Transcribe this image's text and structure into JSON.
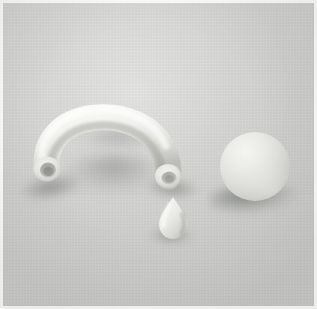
{
  "image": {
    "kind": "photograph",
    "subject": "still-life of three pale clay objects on a gray cloth background",
    "width": 317,
    "height": 309,
    "border": {
      "present": true,
      "color": "#fbfbfa",
      "width_px": 3
    }
  },
  "palette": {
    "background_base": "#d3d4d1",
    "background_light": "#d8d9d6",
    "background_dark": "#cdcecb",
    "object_highlight": "#f6f6f3",
    "object_midtone": "#e6e6e2",
    "object_shade": "#c3c4bf",
    "object_deep_shade": "#a3a49f",
    "cavity_dark": "#8e8f8a",
    "cast_shadow": "#6a6c6a",
    "frame_white": "#fbfbfa"
  },
  "lighting": {
    "key_direction": "upper-left",
    "shadow_direction": "lower-left",
    "quality": "soft diffuse",
    "contrast": "low"
  },
  "objects": [
    {
      "id": "arch-tube",
      "name": "Arched hollow tube",
      "description": "A thick pale tube bent into an inverted-U arch, both ends cut open showing a dark circular cavity",
      "bounds": {
        "x": 30,
        "y": 114,
        "width": 170,
        "height": 76
      },
      "left_opening": {
        "cx": 47,
        "cy": 169,
        "rx": 11,
        "ry": 10
      },
      "right_opening": {
        "cx": 168,
        "cy": 177,
        "rx": 10,
        "ry": 8
      },
      "tube_thickness_px": 26
    },
    {
      "id": "teardrop",
      "name": "Teardrop blob",
      "description": "A small pear/teardrop shaped blob, narrow at the top and rounded at the bottom, sitting below the right tube end",
      "bounds": {
        "x": 158,
        "y": 196,
        "width": 30,
        "height": 42
      }
    },
    {
      "id": "sphere",
      "name": "Matte sphere",
      "description": "A smooth matte ball lit from the upper left with a soft terminator and a cast shadow to the lower left",
      "bounds": {
        "x": 220,
        "y": 132,
        "width": 70,
        "height": 69
      },
      "center": {
        "cx": 255,
        "cy": 166
      },
      "radius_px": 35
    }
  ],
  "shadows": [
    {
      "id": "shadow-arch-left",
      "for": "arch-tube",
      "x": 20,
      "y": 175,
      "width": 62,
      "height": 24
    },
    {
      "id": "shadow-arch-inner",
      "for": "arch-tube",
      "x": 62,
      "y": 155,
      "width": 104,
      "height": 38
    },
    {
      "id": "shadow-arch-top",
      "for": "arch-tube",
      "x": 75,
      "y": 128,
      "width": 86,
      "height": 22
    },
    {
      "id": "shadow-arch-right",
      "for": "arch-tube",
      "x": 146,
      "y": 178,
      "width": 52,
      "height": 20
    },
    {
      "id": "shadow-teardrop",
      "for": "teardrop",
      "x": 150,
      "y": 228,
      "width": 42,
      "height": 15
    },
    {
      "id": "shadow-sphere",
      "for": "sphere",
      "x": 208,
      "y": 183,
      "width": 90,
      "height": 30
    }
  ],
  "text_content": {
    "has_visible_text": false,
    "strings": []
  }
}
